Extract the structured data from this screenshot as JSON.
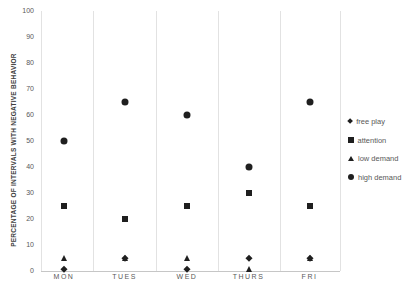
{
  "chart_data": {
    "type": "scatter",
    "title": "",
    "xlabel": "",
    "ylabel": "PERCENTAGE OF INTERVALS WITH NEGATIVE BEHAVIOR",
    "ylim": [
      0,
      100
    ],
    "yticks": [
      100,
      90,
      80,
      70,
      60,
      50,
      40,
      30,
      20,
      10,
      0
    ],
    "categories": [
      "MON",
      "TUES",
      "WED",
      "THURS",
      "FRI"
    ],
    "series": [
      {
        "name": "free play",
        "marker": "diamond",
        "values": [
          0,
          5,
          0,
          5,
          5
        ]
      },
      {
        "name": "attention",
        "marker": "square",
        "values": [
          25,
          20,
          25,
          30,
          25
        ]
      },
      {
        "name": "low demand",
        "marker": "triangle",
        "values": [
          5,
          5,
          5,
          0,
          5
        ]
      },
      {
        "name": "high demand",
        "marker": "circle",
        "values": [
          50,
          65,
          60,
          40,
          65
        ]
      }
    ],
    "grid": "vertical-column-separators",
    "legend_position": "right",
    "colors": {
      "marker": "#1f1f1f",
      "tick_text": "#595959",
      "axis_label_text": "#404040",
      "gridline": "#e2e2e2",
      "axis_line": "#c6c6c6",
      "background": "#ffffff"
    }
  }
}
